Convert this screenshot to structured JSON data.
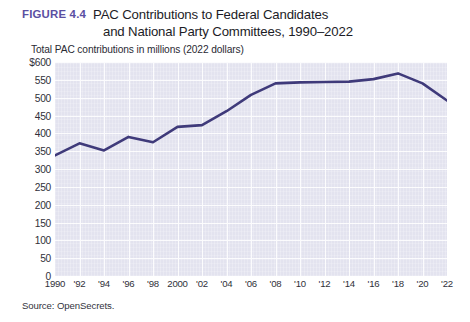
{
  "figure": {
    "label": "FIGURE 4.4",
    "title_line_1": "PAC Contributions to Federal Candidates",
    "title_line_2": "and National Party Committees, 1990–2022",
    "subtitle": "Total PAC contributions in millions (2022 dollars)",
    "source": "Source: OpenSecrets."
  },
  "colors": {
    "accent": "#5b4fa2",
    "line": "#3f3a7a",
    "plot_background": "#e3e3ef",
    "gridline": "#fbfbfd",
    "text": "#1c1c26"
  },
  "chart_data": {
    "type": "line",
    "title": "PAC Contributions to Federal Candidates and National Party Committees, 1990–2022",
    "subtitle": "Total PAC contributions in millions (2022 dollars)",
    "xlabel": "",
    "ylabel": "Total PAC contributions in millions (2022 dollars)",
    "x": [
      1990,
      1992,
      1994,
      1996,
      1998,
      2000,
      2002,
      2004,
      2006,
      2008,
      2010,
      2012,
      2014,
      2016,
      2018,
      2020,
      2022
    ],
    "xticklabels": [
      "1990",
      "'92",
      "'94",
      "'96",
      "'98",
      "2000",
      "'02",
      "'04",
      "'06",
      "'08",
      "'10",
      "'12",
      "'14",
      "'16",
      "'18",
      "'20",
      "'22"
    ],
    "values": [
      338,
      372,
      352,
      390,
      375,
      418,
      423,
      462,
      508,
      540,
      543,
      544,
      545,
      552,
      568,
      540,
      492
    ],
    "yticks": [
      0,
      50,
      100,
      150,
      200,
      250,
      300,
      350,
      400,
      450,
      500,
      550,
      600
    ],
    "yticklabels": [
      "0",
      "50",
      "100",
      "150",
      "200",
      "250",
      "300",
      "350",
      "400",
      "450",
      "500",
      "550",
      "$600"
    ],
    "ylim": [
      0,
      600
    ],
    "xlim": [
      1990,
      2022
    ],
    "grid": true,
    "legend": false,
    "series": [
      {
        "name": "Total PAC contributions",
        "color": "#3f3a7a",
        "values": [
          338,
          372,
          352,
          390,
          375,
          418,
          423,
          462,
          508,
          540,
          543,
          544,
          545,
          552,
          568,
          540,
          492
        ]
      }
    ]
  }
}
